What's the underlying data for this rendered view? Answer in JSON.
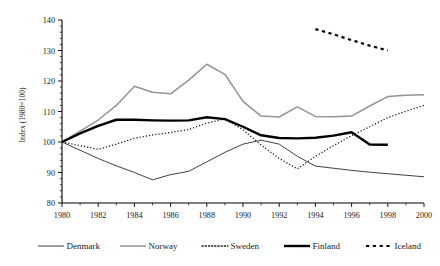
{
  "chart_data": {
    "type": "line",
    "title": "",
    "xlabel": "",
    "ylabel": "Index (1980=100)",
    "xlim": [
      1980,
      2000
    ],
    "ylim": [
      80,
      140
    ],
    "ytick_values": [
      80,
      90,
      100,
      110,
      120,
      130,
      140
    ],
    "ytick_labels": [
      "80",
      "90",
      "100",
      "110",
      "120",
      "130",
      "140"
    ],
    "xtick_values": [
      1980,
      1982,
      1984,
      1986,
      1988,
      1990,
      1992,
      1994,
      1996,
      1998,
      2000
    ],
    "xtick_labels": [
      "1980",
      "1982",
      "1984",
      "1986",
      "1988",
      "1990",
      "1992",
      "1994",
      "1996",
      "1998",
      "2000"
    ],
    "grid": false,
    "legend_position": "bottom",
    "series": [
      {
        "name": "Denmark",
        "style": "solid-thin",
        "color": "#2b2b2b",
        "width": 0.9,
        "x": [
          1980,
          1981,
          1982,
          1983,
          1984,
          1985,
          1986,
          1987,
          1988,
          1989,
          1990,
          1991,
          1992,
          1993,
          1994,
          1995,
          1996,
          1997,
          1998,
          1999,
          2000
        ],
        "y": [
          100.0,
          97.3,
          94.6,
          92.2,
          90.0,
          87.6,
          89.3,
          90.4,
          93.5,
          96.6,
          99.3,
          100.6,
          99.3,
          95.3,
          92.1,
          91.4,
          90.7,
          90.1,
          89.6,
          89.1,
          88.6
        ]
      },
      {
        "name": "Norway",
        "style": "solid-gray",
        "color": "#949494",
        "width": 1.5,
        "x": [
          1980,
          1981,
          1982,
          1983,
          1984,
          1985,
          1986,
          1987,
          1988,
          1989,
          1990,
          1991,
          1992,
          1993,
          1994,
          1995,
          1996,
          1997,
          1998,
          1999,
          2000
        ],
        "y": [
          100.0,
          103.6,
          107.2,
          112.0,
          118.3,
          116.3,
          115.8,
          120.3,
          125.5,
          122.2,
          113.3,
          108.5,
          108.2,
          111.5,
          108.4,
          108.3,
          108.5,
          111.8,
          114.9,
          115.3,
          115.5
        ]
      },
      {
        "name": "Sweden",
        "style": "dotted",
        "color": "#1a1a1a",
        "width": 1.3,
        "x": [
          1980,
          1981,
          1982,
          1983,
          1984,
          1985,
          1986,
          1987,
          1988,
          1989,
          1990,
          1991,
          1992,
          1993,
          1994,
          1995,
          1996,
          1997,
          1998,
          1999,
          2000
        ],
        "y": [
          100.0,
          98.8,
          97.6,
          99.3,
          101.2,
          102.3,
          103.1,
          104.1,
          106.2,
          107.6,
          104.0,
          99.0,
          94.6,
          91.2,
          95.3,
          98.8,
          102.1,
          105.0,
          108.0,
          110.1,
          112.0
        ]
      },
      {
        "name": "Finland",
        "style": "solid-thick",
        "color": "#000000",
        "width": 2.4,
        "x": [
          1980,
          1981,
          1982,
          1983,
          1984,
          1985,
          1986,
          1987,
          1988,
          1989,
          1990,
          1991,
          1992,
          1993,
          1994,
          1995,
          1996,
          1997,
          1998
        ],
        "y": [
          100.0,
          102.8,
          105.3,
          107.3,
          107.3,
          107.1,
          107.0,
          107.1,
          108.1,
          107.5,
          105.0,
          102.2,
          101.3,
          101.2,
          101.4,
          102.1,
          103.2,
          99.2,
          99.1
        ]
      },
      {
        "name": "Iceland",
        "style": "dashed-bold",
        "color": "#000000",
        "width": 2.2,
        "x": [
          1994,
          1995,
          1996,
          1997,
          1998
        ],
        "y": [
          137.0,
          135.3,
          133.4,
          131.6,
          130.0
        ]
      }
    ]
  },
  "legend": {
    "items": [
      {
        "label": "Denmark",
        "swatch": "solid-thin"
      },
      {
        "label": "Norway",
        "swatch": "solid-gray"
      },
      {
        "label": "Sweden",
        "swatch": "dotted"
      },
      {
        "label": "Finland",
        "swatch": "solid-thick"
      },
      {
        "label": "Iceland",
        "swatch": "dashed-bold"
      }
    ]
  }
}
